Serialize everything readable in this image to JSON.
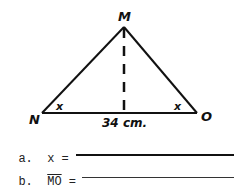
{
  "figure": {
    "type": "isosceles triangle with altitude",
    "vertices": {
      "top": "M",
      "left": "N",
      "right": "O"
    },
    "angle_labels": {
      "left": "x",
      "right": "x"
    },
    "base_label": "34 cm.",
    "altitude": "dashed line from M to base midpoint"
  },
  "questions": [
    {
      "letter": "a.",
      "label": "x =",
      "answer": ""
    },
    {
      "letter": "b.",
      "label": "MO",
      "equals": "=",
      "answer": ""
    }
  ]
}
